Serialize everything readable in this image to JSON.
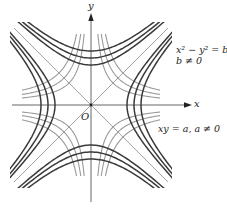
{
  "figure": {
    "origin_label": "O",
    "x_axis_label": "x",
    "y_axis_label": "y",
    "family_b": {
      "equation_line1": "x² − y² = b,",
      "equation_line2": "b ≠ 0",
      "color": "#3a3a3a",
      "description": "dark hyperbolas x^2 - y^2 = b"
    },
    "family_a": {
      "equation": "xy = a,  a ≠ 0",
      "color": "#9a9a9a",
      "description": "gray hyperbolas xy = a"
    },
    "axis_color": "#555555",
    "asymptote_color": "#8a8a8a"
  }
}
